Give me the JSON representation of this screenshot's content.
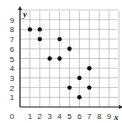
{
  "chart_data": {
    "type": "scatter",
    "title": "",
    "xlabel": "x",
    "ylabel": "y",
    "xlim": [
      0,
      9
    ],
    "ylim": [
      0,
      9
    ],
    "grid": true,
    "x_ticks": [
      "0",
      "1",
      "2",
      "3",
      "4",
      "5",
      "6",
      "7",
      "8",
      "9"
    ],
    "y_ticks": [
      "1",
      "2",
      "3",
      "4",
      "5",
      "6",
      "7",
      "8",
      "9"
    ],
    "points": [
      {
        "x": 1,
        "y": 8
      },
      {
        "x": 2,
        "y": 8
      },
      {
        "x": 2,
        "y": 7
      },
      {
        "x": 4,
        "y": 7
      },
      {
        "x": 5,
        "y": 6
      },
      {
        "x": 3,
        "y": 5
      },
      {
        "x": 4,
        "y": 5
      },
      {
        "x": 7,
        "y": 4
      },
      {
        "x": 6,
        "y": 3
      },
      {
        "x": 5,
        "y": 2
      },
      {
        "x": 7,
        "y": 2
      },
      {
        "x": 6,
        "y": 1
      }
    ],
    "colors": {
      "point": "#111111",
      "grid": "#bbbbbb",
      "axis": "#222222"
    }
  }
}
